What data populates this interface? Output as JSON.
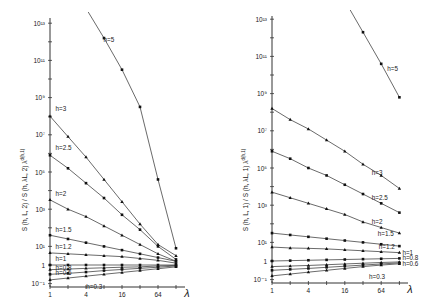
{
  "chart_data": [
    {
      "type": "line",
      "panel": "left",
      "title": "",
      "xlabel": "λ",
      "ylabel": "S (h, L, 2) / S (h, λL, 2) λ^{d(h,1)}",
      "xscale": "log2",
      "yscale": "log10",
      "x_ticks": [
        1,
        4,
        16,
        64
      ],
      "x_tick_labels": [
        "1",
        "4",
        "16",
        "64"
      ],
      "y_tick_labels": [
        "10^13",
        "10^11",
        "10^9",
        "10^7",
        "10^5",
        "10^3",
        "10^1",
        "1",
        "10^-1"
      ],
      "xlim": [
        1,
        128
      ],
      "ylim_log10": [
        -1.2,
        13
      ],
      "x": [
        1,
        2,
        4,
        8,
        16,
        32,
        64,
        128
      ],
      "series": [
        {
          "name": "h=5",
          "label_at": [
            7,
            12.0
          ],
          "log10_values": [
            16.8,
            15.3,
            13.8,
            12.2,
            10.5,
            8.5,
            4.6,
            0.9
          ]
        },
        {
          "name": "h=3",
          "label_at": [
            1.1,
            8.3
          ],
          "log10_values": [
            8.0,
            6.9,
            5.8,
            4.6,
            3.4,
            2.2,
            1.1,
            0.5
          ]
        },
        {
          "name": "h=2.5",
          "label_at": [
            1.1,
            6.2
          ],
          "log10_values": [
            5.9,
            5.2,
            4.4,
            3.6,
            2.7,
            1.9,
            1.0,
            0.3
          ]
        },
        {
          "name": "h=2",
          "label_at": [
            1.1,
            3.7
          ],
          "log10_values": [
            3.5,
            3.0,
            2.6,
            2.1,
            1.6,
            1.1,
            0.6,
            0.2
          ]
        },
        {
          "name": "h=1.5",
          "label_at": [
            1.1,
            1.8
          ],
          "log10_values": [
            1.6,
            1.4,
            1.2,
            1.0,
            0.8,
            0.6,
            0.4,
            0.2
          ]
        },
        {
          "name": "h=1.2",
          "label_at": [
            1.1,
            0.85
          ],
          "log10_values": [
            0.65,
            0.6,
            0.55,
            0.5,
            0.45,
            0.35,
            0.25,
            0.1
          ]
        },
        {
          "name": "h=1",
          "label_at": [
            1.1,
            0.2
          ],
          "log10_values": [
            0.0,
            0.0,
            0.0,
            0.0,
            0.0,
            0.0,
            0.0,
            0.0
          ]
        },
        {
          "name": "h=0.8",
          "label_at": [
            1.1,
            -0.25
          ],
          "log10_values": [
            -0.25,
            -0.22,
            -0.18,
            -0.15,
            -0.12,
            -0.1,
            -0.05,
            -0.02
          ]
        },
        {
          "name": "h=0.6",
          "label_at": [
            1.1,
            -0.55
          ],
          "log10_values": [
            -0.5,
            -0.45,
            -0.38,
            -0.3,
            -0.24,
            -0.18,
            -0.12,
            -0.05
          ]
        },
        {
          "name": "h=0.3",
          "label_at": [
            3.6,
            -1.3
          ],
          "log10_values": [
            -0.8,
            -0.7,
            -0.6,
            -0.5,
            -0.4,
            -0.3,
            -0.2,
            -0.1
          ]
        }
      ]
    },
    {
      "type": "line",
      "panel": "right",
      "title": "",
      "xlabel": "λ",
      "ylabel": "S (h, L, 1) / S (h, λL, 1) λ^{d(h,1)}",
      "xscale": "log2",
      "yscale": "log10",
      "x_ticks": [
        1,
        4,
        16,
        64
      ],
      "x_tick_labels": [
        "1",
        "4",
        "16",
        "64"
      ],
      "y_tick_labels": [
        "10^13",
        "10^11",
        "10^9",
        "10^7",
        "10^5",
        "10^3",
        "10^1",
        "1",
        "10^-1"
      ],
      "xlim": [
        1,
        128
      ],
      "ylim_log10": [
        -1.2,
        13
      ],
      "x": [
        1,
        2,
        4,
        8,
        16,
        32,
        64,
        128
      ],
      "series": [
        {
          "name": "h=5",
          "label_at": [
            72,
            10.2
          ],
          "log10_values": [
            null,
            null,
            null,
            null,
            14.0,
            12.3,
            10.6,
            8.8
          ]
        },
        {
          "name": "h=3",
          "label_at": [
            40,
            4.6
          ],
          "log10_values": [
            8.2,
            7.6,
            7.1,
            6.5,
            5.9,
            5.2,
            4.6,
            3.9
          ]
        },
        {
          "name": "h=2.5",
          "label_at": [
            40,
            3.3
          ],
          "log10_values": [
            5.9,
            5.5,
            5.0,
            4.6,
            4.1,
            3.6,
            3.1,
            2.6
          ]
        },
        {
          "name": "h=2",
          "label_at": [
            40,
            2.0
          ],
          "log10_values": [
            3.7,
            3.4,
            3.1,
            2.8,
            2.5,
            2.1,
            1.8,
            1.5
          ]
        },
        {
          "name": "h=1.5",
          "label_at": [
            50,
            1.35
          ],
          "log10_values": [
            1.5,
            1.4,
            1.3,
            1.2,
            1.1,
            1.0,
            0.9,
            0.8
          ]
        },
        {
          "name": "h=1.2",
          "label_at": [
            52,
            0.65
          ],
          "log10_values": [
            0.75,
            0.7,
            0.68,
            0.65,
            0.6,
            0.55,
            0.5,
            0.45
          ]
        },
        {
          "name": "h=1",
          "label_at": [
            128,
            0.3
          ],
          "log10_values": [
            0.0,
            0.02,
            0.04,
            0.06,
            0.08,
            0.1,
            0.12,
            0.14
          ]
        },
        {
          "name": "h=0.8",
          "label_at": [
            128,
            0.05
          ],
          "log10_values": [
            -0.3,
            -0.27,
            -0.24,
            -0.2,
            -0.16,
            -0.12,
            -0.08,
            -0.05
          ]
        },
        {
          "name": "h=0.6",
          "label_at": [
            128,
            -0.25
          ],
          "log10_values": [
            -0.5,
            -0.45,
            -0.4,
            -0.34,
            -0.28,
            -0.22,
            -0.16,
            -0.1
          ]
        },
        {
          "name": "h=0.3",
          "label_at": [
            36,
            -0.95
          ],
          "log10_values": [
            -0.8,
            -0.7,
            -0.6,
            -0.5,
            -0.4,
            -0.3,
            -0.22,
            -0.15
          ]
        }
      ]
    }
  ],
  "panels": {
    "left": {
      "ylabel": "S (h, L, 2) / S (h, λL, 2) λ",
      "ylabel_sup": "d(h,1)",
      "xlabel": "λ"
    },
    "right": {
      "ylabel": "S (h, L, 1) / S (h, λL, 1) λ",
      "ylabel_sup": "d(h,1)",
      "xlabel": "λ"
    }
  }
}
